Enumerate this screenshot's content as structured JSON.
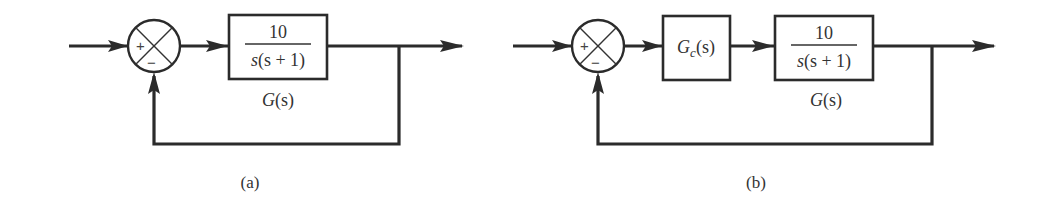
{
  "diagram_a": {
    "caption": "(a)",
    "summing_junction": {
      "plus_sign": "+",
      "minus_sign": "−"
    },
    "plant_block": {
      "numerator": "10",
      "denominator_s": "s",
      "denominator_rest": "(s + 1)",
      "label_G": "G",
      "label_args": "(s)"
    }
  },
  "diagram_b": {
    "caption": "(b)",
    "summing_junction": {
      "plus_sign": "+",
      "minus_sign": "−"
    },
    "controller_block": {
      "label_G": "G",
      "subscript": "c",
      "label_args": "(s)"
    },
    "plant_block": {
      "numerator": "10",
      "denominator_s": "s",
      "denominator_rest": "(s + 1)",
      "label_G": "G",
      "label_args": "(s)"
    }
  },
  "colors": {
    "line": "#2b2b2b",
    "text": "#333333",
    "background": "#ffffff"
  }
}
